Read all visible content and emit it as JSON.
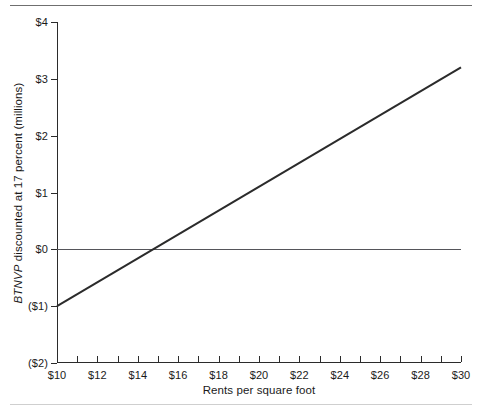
{
  "chart_data": {
    "type": "line",
    "title": "",
    "xlabel": "Rents per square foot",
    "ylabel_parts": {
      "emphasis": "BTNVP",
      "rest": " discounted at 17 percent (millions)"
    },
    "ylabel": "BTNVP discounted at 17 percent (millions)",
    "xlim": [
      10,
      30
    ],
    "ylim": [
      -2,
      4
    ],
    "grid": false,
    "legend": "none",
    "x_tick_labels": [
      "$10",
      "$12",
      "$14",
      "$16",
      "$18",
      "$20",
      "$22",
      "$24",
      "$26",
      "$28",
      "$30"
    ],
    "x_tick_values": [
      10,
      12,
      14,
      16,
      18,
      20,
      22,
      24,
      26,
      28,
      30
    ],
    "x_minor_tick_values": [
      10,
      11,
      12,
      13,
      14,
      15,
      16,
      17,
      18,
      19,
      20,
      21,
      22,
      23,
      24,
      25,
      26,
      27,
      28,
      29,
      30
    ],
    "y_tick_labels": [
      "$4",
      "$3",
      "$2",
      "$1",
      "$0",
      "($1)",
      "($2)"
    ],
    "y_tick_values": [
      4,
      3,
      2,
      1,
      0,
      -1,
      -2
    ],
    "zero_reference_line": 0,
    "series": [
      {
        "name": "BTNVP",
        "color": "#2b2b2b",
        "line_width": 2,
        "x": [
          10,
          30
        ],
        "values": [
          -1.0,
          3.2
        ],
        "breakeven_x": 14.76,
        "slope_per_dollar": 0.21
      }
    ]
  }
}
